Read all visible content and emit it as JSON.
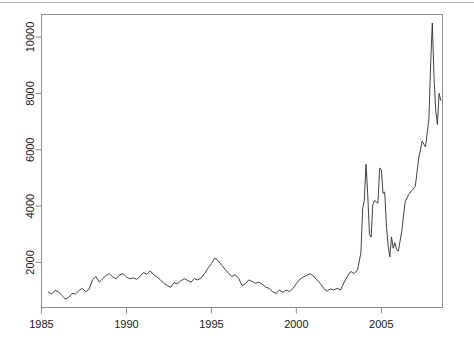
{
  "figure": {
    "background_color": "#ffffff",
    "line_color": "#2b2b2b",
    "axis_color": "#8c8c8c",
    "text_color": "#1a1a1a",
    "top_rule_color": "#b8b8b8"
  },
  "chart_data": {
    "type": "line",
    "title": "",
    "subtitle": "",
    "xlabel": "",
    "ylabel": "",
    "xlim": [
      1985.0,
      2008.6
    ],
    "ylim": [
      400,
      10800
    ],
    "grid": false,
    "legend": null,
    "legend_position": "none",
    "x_ticks": [
      1985,
      1990,
      1995,
      2000,
      2005
    ],
    "x_tick_labels": [
      "1985",
      "1990",
      "1995",
      "2000",
      "2005"
    ],
    "y_ticks": [
      2000,
      4000,
      6000,
      8000,
      10000
    ],
    "y_tick_labels": [
      "2000",
      "4000",
      "6000",
      "8000",
      "10000"
    ],
    "y_tick_label_rotation": 90,
    "series": [
      {
        "name": "series-1",
        "x": [
          1985.4,
          1985.6,
          1985.8,
          1986.0,
          1986.2,
          1986.4,
          1986.6,
          1986.8,
          1987.0,
          1987.2,
          1987.4,
          1987.6,
          1987.8,
          1988.0,
          1988.2,
          1988.4,
          1988.6,
          1988.8,
          1989.0,
          1989.2,
          1989.4,
          1989.6,
          1989.8,
          1990.0,
          1990.2,
          1990.4,
          1990.6,
          1990.8,
          1991.0,
          1991.2,
          1991.4,
          1991.6,
          1991.8,
          1992.0,
          1992.2,
          1992.4,
          1992.6,
          1992.8,
          1993.0,
          1993.2,
          1993.4,
          1993.6,
          1993.8,
          1994.0,
          1994.2,
          1994.4,
          1994.6,
          1994.8,
          1995.0,
          1995.2,
          1995.4,
          1995.6,
          1995.8,
          1996.0,
          1996.2,
          1996.4,
          1996.6,
          1996.8,
          1997.0,
          1997.2,
          1997.4,
          1997.6,
          1997.8,
          1998.0,
          1998.2,
          1998.4,
          1998.6,
          1998.8,
          1999.0,
          1999.2,
          1999.4,
          1999.6,
          1999.8,
          2000.0,
          2000.2,
          2000.4,
          2000.6,
          2000.8,
          2001.0,
          2001.2,
          2001.4,
          2001.6,
          2001.8,
          2002.0,
          2002.2,
          2002.4,
          2002.6,
          2002.8,
          2003.0,
          2003.2,
          2003.4,
          2003.6,
          2003.8,
          2003.9,
          2004.0,
          2004.1,
          2004.2,
          2004.3,
          2004.4,
          2004.5,
          2004.6,
          2004.7,
          2004.8,
          2004.9,
          2005.0,
          2005.1,
          2005.2,
          2005.3,
          2005.4,
          2005.5,
          2005.6,
          2005.7,
          2005.8,
          2005.9,
          2006.0,
          2006.2,
          2006.4,
          2006.6,
          2006.8,
          2007.0,
          2007.2,
          2007.4,
          2007.6,
          2007.8,
          2007.9,
          2008.0,
          2008.1,
          2008.2,
          2008.3,
          2008.4,
          2008.5
        ],
        "values": [
          950,
          880,
          1000,
          960,
          830,
          700,
          760,
          900,
          880,
          1000,
          1080,
          960,
          1050,
          1380,
          1500,
          1300,
          1420,
          1540,
          1600,
          1480,
          1420,
          1560,
          1600,
          1480,
          1420,
          1450,
          1400,
          1500,
          1640,
          1580,
          1700,
          1560,
          1480,
          1380,
          1260,
          1180,
          1120,
          1280,
          1240,
          1350,
          1420,
          1360,
          1300,
          1420,
          1380,
          1450,
          1600,
          1800,
          1960,
          2150,
          2060,
          1900,
          1760,
          1620,
          1500,
          1560,
          1440,
          1180,
          1240,
          1380,
          1320,
          1260,
          1300,
          1220,
          1120,
          1080,
          960,
          900,
          1020,
          940,
          1020,
          960,
          1080,
          1250,
          1400,
          1480,
          1540,
          1600,
          1520,
          1380,
          1260,
          1080,
          980,
          1060,
          1020,
          1080,
          1020,
          1280,
          1500,
          1680,
          1600,
          1740,
          2350,
          3900,
          4200,
          5480,
          4400,
          3000,
          2900,
          4050,
          4200,
          4150,
          4100,
          5350,
          5300,
          4450,
          4500,
          3300,
          2600,
          2200,
          2900,
          2500,
          2700,
          2450,
          2400,
          3100,
          4150,
          4400,
          4550,
          4700,
          5700,
          6300,
          6100,
          7100,
          9000,
          10500,
          8600,
          7400,
          6900,
          8000,
          7750
        ]
      }
    ]
  }
}
